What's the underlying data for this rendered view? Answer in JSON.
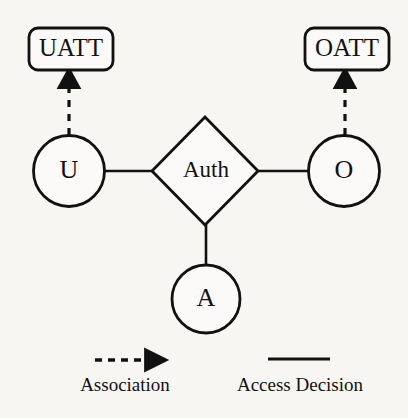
{
  "diagram": {
    "background_color": "#f7f6f3",
    "stroke_color": "#111111",
    "text_color": "#121212",
    "nodes": {
      "uatt": {
        "label": "UATT",
        "shape": "rounded-rectangle"
      },
      "oatt": {
        "label": "OATT",
        "shape": "rounded-rectangle"
      },
      "user": {
        "label": "U",
        "shape": "circle"
      },
      "object": {
        "label": "O",
        "shape": "circle"
      },
      "action": {
        "label": "A",
        "shape": "circle"
      },
      "auth": {
        "label": "Auth",
        "shape": "diamond"
      }
    },
    "edges": [
      {
        "name": "user-to-uatt",
        "style": "dashed-arrow",
        "from": "U",
        "to": "UATT"
      },
      {
        "name": "object-to-oatt",
        "style": "dashed-arrow",
        "from": "O",
        "to": "OATT"
      },
      {
        "name": "user-to-auth",
        "style": "solid-line",
        "from": "U",
        "to": "Auth"
      },
      {
        "name": "auth-to-object",
        "style": "solid-line",
        "from": "Auth",
        "to": "O"
      },
      {
        "name": "auth-to-action",
        "style": "solid-line",
        "from": "Auth",
        "to": "A"
      }
    ]
  },
  "legend": {
    "items": [
      {
        "key": "association",
        "label": "Association",
        "style": "dashed-arrow"
      },
      {
        "key": "access-decision",
        "label": "Access Decision",
        "style": "solid-line"
      }
    ]
  }
}
